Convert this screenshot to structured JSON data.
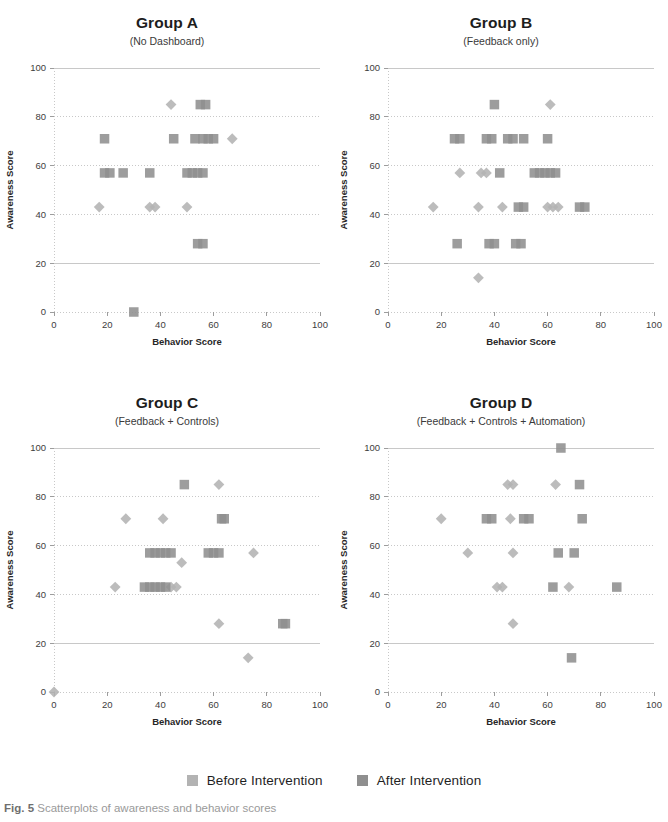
{
  "figure": {
    "caption_prefix": "Fig. 5",
    "caption_text": "Scatterplots of awareness and behavior scores",
    "marker_color_before": "#b3b3b3",
    "marker_color_after": "#8f8f8f",
    "grid_color": "#c8c8c8",
    "axis_color": "#9d9d9d"
  },
  "legend": {
    "items": [
      {
        "label": "Before Intervention",
        "color": "#b3b3b3",
        "shape": "square"
      },
      {
        "label": "After Intervention",
        "color": "#8f8f8f",
        "shape": "square"
      }
    ]
  },
  "chart_data": [
    {
      "type": "scatter",
      "title": "Group A",
      "subtitle": "(No Dashboard)",
      "xlabel": "Behavior Score",
      "ylabel": "Awareness Score",
      "xlim": [
        0,
        100
      ],
      "ylim": [
        0,
        100
      ],
      "xticks": [
        0,
        20,
        40,
        60,
        80,
        100
      ],
      "yticks": [
        0,
        20,
        40,
        60,
        80,
        100
      ],
      "grid": true,
      "legend_position": "bottom-figure",
      "series": [
        {
          "name": "Before Intervention",
          "marker": "diamond",
          "color": "#b3b3b3",
          "points": [
            [
              44,
              85
            ],
            [
              67,
              71
            ],
            [
              17,
              43
            ],
            [
              36,
              43
            ],
            [
              38,
              43
            ],
            [
              50,
              43
            ]
          ]
        },
        {
          "name": "After Intervention",
          "marker": "square",
          "color": "#8f8f8f",
          "points": [
            [
              55,
              85
            ],
            [
              57,
              85
            ],
            [
              19,
              71
            ],
            [
              45,
              71
            ],
            [
              53,
              71
            ],
            [
              56,
              71
            ],
            [
              58,
              71
            ],
            [
              60,
              71
            ],
            [
              19,
              57
            ],
            [
              21,
              57
            ],
            [
              26,
              57
            ],
            [
              36,
              57
            ],
            [
              50,
              57
            ],
            [
              52,
              57
            ],
            [
              54,
              57
            ],
            [
              56,
              57
            ],
            [
              54,
              28
            ],
            [
              56,
              28
            ],
            [
              30,
              0
            ]
          ]
        }
      ]
    },
    {
      "type": "scatter",
      "title": "Group B",
      "subtitle": "(Feedback only)",
      "xlabel": "Behavior Score",
      "ylabel": "Awareness Score",
      "xlim": [
        0,
        100
      ],
      "ylim": [
        0,
        100
      ],
      "xticks": [
        0,
        20,
        40,
        60,
        80,
        100
      ],
      "yticks": [
        0,
        20,
        40,
        60,
        80,
        100
      ],
      "grid": true,
      "legend_position": "bottom-figure",
      "series": [
        {
          "name": "Before Intervention",
          "marker": "diamond",
          "color": "#b3b3b3",
          "points": [
            [
              61,
              85
            ],
            [
              27,
              57
            ],
            [
              35,
              57
            ],
            [
              37,
              57
            ],
            [
              17,
              43
            ],
            [
              34,
              43
            ],
            [
              43,
              43
            ],
            [
              60,
              43
            ],
            [
              62,
              43
            ],
            [
              64,
              43
            ],
            [
              34,
              14
            ]
          ]
        },
        {
          "name": "After Intervention",
          "marker": "square",
          "color": "#8f8f8f",
          "points": [
            [
              40,
              85
            ],
            [
              25,
              71
            ],
            [
              27,
              71
            ],
            [
              37,
              71
            ],
            [
              39,
              71
            ],
            [
              45,
              71
            ],
            [
              47,
              71
            ],
            [
              51,
              71
            ],
            [
              60,
              71
            ],
            [
              42,
              57
            ],
            [
              55,
              57
            ],
            [
              57,
              57
            ],
            [
              59,
              57
            ],
            [
              61,
              57
            ],
            [
              63,
              57
            ],
            [
              49,
              43
            ],
            [
              51,
              43
            ],
            [
              72,
              43
            ],
            [
              74,
              43
            ],
            [
              26,
              28
            ],
            [
              38,
              28
            ],
            [
              40,
              28
            ],
            [
              48,
              28
            ],
            [
              50,
              28
            ]
          ]
        }
      ]
    },
    {
      "type": "scatter",
      "title": "Group C",
      "subtitle": "(Feedback + Controls)",
      "xlabel": "Behavior Score",
      "ylabel": "Awareness Score",
      "xlim": [
        0,
        100
      ],
      "ylim": [
        0,
        100
      ],
      "xticks": [
        0,
        20,
        40,
        60,
        80,
        100
      ],
      "yticks": [
        0,
        20,
        40,
        60,
        80,
        100
      ],
      "grid": true,
      "legend_position": "bottom-figure",
      "series": [
        {
          "name": "Before Intervention",
          "marker": "diamond",
          "color": "#b3b3b3",
          "points": [
            [
              62,
              85
            ],
            [
              27,
              71
            ],
            [
              41,
              71
            ],
            [
              48,
              53
            ],
            [
              75,
              57
            ],
            [
              23,
              43
            ],
            [
              44,
              43
            ],
            [
              46,
              43
            ],
            [
              62,
              28
            ],
            [
              73,
              14
            ],
            [
              0,
              0
            ]
          ]
        },
        {
          "name": "After Intervention",
          "marker": "square",
          "color": "#8f8f8f",
          "points": [
            [
              49,
              85
            ],
            [
              63,
              71
            ],
            [
              64,
              71
            ],
            [
              36,
              57
            ],
            [
              38,
              57
            ],
            [
              40,
              57
            ],
            [
              42,
              57
            ],
            [
              44,
              57
            ],
            [
              58,
              57
            ],
            [
              60,
              57
            ],
            [
              62,
              57
            ],
            [
              34,
              43
            ],
            [
              36,
              43
            ],
            [
              38,
              43
            ],
            [
              40,
              43
            ],
            [
              42,
              43
            ],
            [
              86,
              28
            ],
            [
              87,
              28
            ]
          ]
        }
      ]
    },
    {
      "type": "scatter",
      "title": "Group D",
      "subtitle": "(Feedback + Controls + Automation)",
      "xlabel": "Behavior Score",
      "ylabel": "Awareness Score",
      "xlim": [
        0,
        100
      ],
      "ylim": [
        0,
        100
      ],
      "xticks": [
        0,
        20,
        40,
        60,
        80,
        100
      ],
      "yticks": [
        0,
        20,
        40,
        60,
        80,
        100
      ],
      "grid": true,
      "legend_position": "bottom-figure",
      "series": [
        {
          "name": "Before Intervention",
          "marker": "diamond",
          "color": "#b3b3b3",
          "points": [
            [
              45,
              85
            ],
            [
              47,
              85
            ],
            [
              63,
              85
            ],
            [
              20,
              71
            ],
            [
              46,
              71
            ],
            [
              30,
              57
            ],
            [
              47,
              57
            ],
            [
              41,
              43
            ],
            [
              43,
              43
            ],
            [
              68,
              43
            ],
            [
              47,
              28
            ]
          ]
        },
        {
          "name": "After Intervention",
          "marker": "square",
          "color": "#8f8f8f",
          "points": [
            [
              65,
              100
            ],
            [
              72,
              85
            ],
            [
              37,
              71
            ],
            [
              39,
              71
            ],
            [
              51,
              71
            ],
            [
              53,
              71
            ],
            [
              73,
              71
            ],
            [
              64,
              57
            ],
            [
              70,
              57
            ],
            [
              62,
              43
            ],
            [
              86,
              43
            ],
            [
              69,
              14
            ]
          ]
        }
      ]
    }
  ]
}
